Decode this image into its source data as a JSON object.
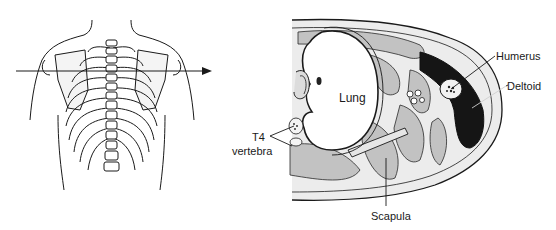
{
  "figure": {
    "type": "anatomical-diagram",
    "left_panel": {
      "view": "posterior thorax with transverse section line",
      "arrow": "section-plane-arrow"
    },
    "right_panel": {
      "view": "transverse cross-section at level of T4",
      "labels": {
        "lung": "Lung",
        "humerus": "Humerus",
        "deltoid": "Deltoid",
        "t4": "T4",
        "vertebra": "vertebra",
        "scapula": "Scapula"
      }
    },
    "colors": {
      "line": "#1a1a1a",
      "deltoid_fill": "#151515",
      "muscle_fill": "#bdbdbd",
      "background": "#ffffff"
    }
  }
}
